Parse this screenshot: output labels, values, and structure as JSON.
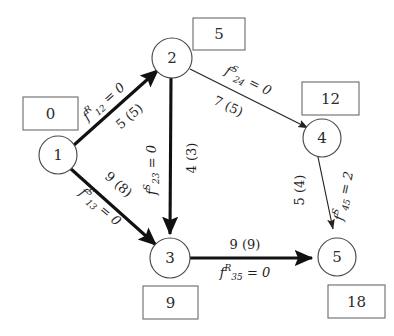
{
  "diagram": {
    "type": "network-flow-graph",
    "title": "",
    "nodes": [
      {
        "id": "1",
        "label": "1",
        "cx": 58,
        "cy": 155,
        "r": 19,
        "supply": "0",
        "supply_box": {
          "x": 23,
          "y": 97,
          "w": 55,
          "h": 33
        }
      },
      {
        "id": "2",
        "label": "2",
        "cx": 172,
        "cy": 58,
        "r": 20,
        "supply": "5",
        "supply_box": {
          "x": 193,
          "y": 18,
          "w": 52,
          "h": 32
        }
      },
      {
        "id": "3",
        "label": "3",
        "cx": 170,
        "cy": 258,
        "r": 20,
        "supply": "9",
        "supply_box": {
          "x": 143,
          "y": 286,
          "w": 55,
          "h": 33
        }
      },
      {
        "id": "4",
        "label": "4",
        "cx": 322,
        "cy": 138,
        "r": 19,
        "supply": "12",
        "supply_box": {
          "x": 302,
          "y": 82,
          "w": 57,
          "h": 33
        }
      },
      {
        "id": "5",
        "label": "5",
        "cx": 337,
        "cy": 257,
        "r": 19,
        "supply": "18",
        "supply_box": {
          "x": 328,
          "y": 285,
          "w": 57,
          "h": 33
        }
      }
    ],
    "edges": [
      {
        "id": "e12",
        "from": "1",
        "to": "2",
        "weight": "thick",
        "flow_label": {
          "f": "f",
          "superscript": "R",
          "subscript": "12",
          "equals": "= 0",
          "full": "f^R_12 = 0"
        },
        "capacity_label": {
          "cost": "5",
          "capacity": "(5)",
          "full": "5 (5)"
        }
      },
      {
        "id": "e13",
        "from": "1",
        "to": "3",
        "weight": "thick",
        "flow_label": {
          "f": "f",
          "superscript": "S",
          "subscript": "13",
          "equals": "= 0",
          "full": "f^S_13 = 0"
        },
        "capacity_label": {
          "cost": "9",
          "capacity": "(8)",
          "full": "9 (8)"
        }
      },
      {
        "id": "e23",
        "from": "2",
        "to": "3",
        "weight": "thick",
        "flow_label": {
          "f": "f",
          "superscript": "S",
          "subscript": "23",
          "equals": "= 0",
          "full": "f^S_23 = 0"
        },
        "capacity_label": {
          "cost": "4",
          "capacity": "(3)",
          "full": "4 (3)"
        }
      },
      {
        "id": "e24",
        "from": "2",
        "to": "4",
        "weight": "thin",
        "flow_label": {
          "f": "f",
          "superscript": "S",
          "subscript": "24",
          "equals": "= 0",
          "full": "f^S_24 = 0"
        },
        "capacity_label": {
          "cost": "7",
          "capacity": "(5)",
          "full": "7 (5)"
        }
      },
      {
        "id": "e45",
        "from": "4",
        "to": "5",
        "weight": "thin",
        "flow_label": {
          "f": "f",
          "superscript": "S",
          "subscript": "45",
          "equals": "= 2",
          "full": "f^S_45 = 2"
        },
        "capacity_label": {
          "cost": "5",
          "capacity": "(4)",
          "full": "5 (4)"
        }
      },
      {
        "id": "e35",
        "from": "3",
        "to": "5",
        "weight": "thick",
        "flow_label": {
          "f": "f",
          "superscript": "R",
          "subscript": "35",
          "equals": "= 0",
          "full": "f^R_35 = 0"
        },
        "capacity_label": {
          "cost": "9",
          "capacity": "(9)",
          "full": "9 (9)"
        }
      }
    ],
    "colors": {
      "background": "#ffffff",
      "node_stroke": "#4a4a4a",
      "box_stroke": "#6a6a6a",
      "edge_thick": "#111111",
      "edge_thin": "#222222",
      "text": "#1e1e1e"
    }
  }
}
